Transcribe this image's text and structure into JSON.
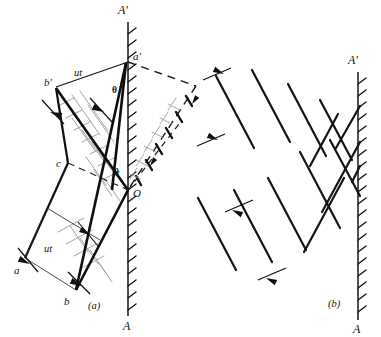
{
  "figure": {
    "ink_color": "#111111",
    "faint_color": "#8d8d8d",
    "background": "#ffffff",
    "width": 381,
    "height": 337
  },
  "panel_a": {
    "caption": "(a)",
    "wall_top_label": "A'",
    "wall_bottom_label": "A",
    "wall_x": 128,
    "wall_top_y": 22,
    "wall_bottom_y": 316,
    "points": [
      {
        "name": "a-prime",
        "label": "a'",
        "x": 128,
        "y": 62,
        "label_x": 133,
        "label_y": 60
      },
      {
        "name": "b-prime",
        "label": "b'",
        "x": 56,
        "y": 87,
        "label_x": 46,
        "label_y": 86
      },
      {
        "name": "origin",
        "label": "O",
        "x": 128,
        "y": 190,
        "label_x": 133,
        "label_y": 196
      },
      {
        "name": "c",
        "label": "c",
        "x": 68,
        "y": 163,
        "label_x": 57,
        "label_y": 166
      },
      {
        "name": "a",
        "label": "a",
        "x": 25,
        "y": 258,
        "label_x": 16,
        "label_y": 272
      },
      {
        "name": "b",
        "label": "b",
        "x": 76,
        "y": 290,
        "label_x": 66,
        "label_y": 303
      }
    ],
    "distance_labels": [
      {
        "name": "ut-upper",
        "label": "ut",
        "x": 80,
        "y": 74
      },
      {
        "name": "ut-lower",
        "label": "ut",
        "x": 50,
        "y": 249
      }
    ],
    "angle_labels": [
      {
        "name": "theta-upper",
        "label": "θ",
        "x": 114,
        "y": 90
      },
      {
        "name": "theta-lower",
        "label": "θ",
        "x": 116,
        "y": 172
      }
    ]
  },
  "panel_b": {
    "caption": "(b)",
    "wall_top_label": "A'",
    "wall_bottom_label": "A",
    "wall_x": 358,
    "wall_top_y": 72,
    "wall_bottom_y": 320,
    "wavelength_markers": [
      {
        "name": "wavelength-marker-upper"
      },
      {
        "name": "wavelength-marker-lower"
      }
    ]
  }
}
